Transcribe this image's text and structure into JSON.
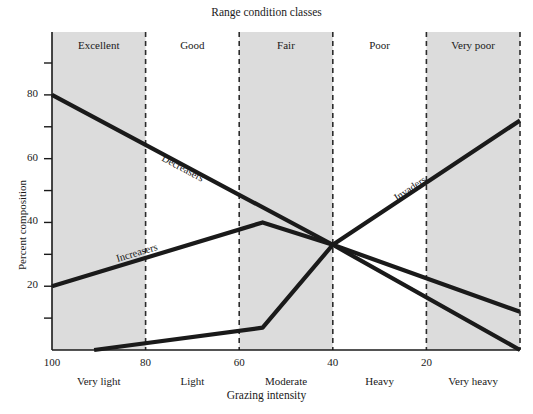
{
  "chart_data": {
    "type": "line",
    "title": "Range condition classes",
    "xlabel": "Grazing intensity",
    "ylabel": "Percent composition",
    "xlim": [
      100,
      0
    ],
    "ylim": [
      0,
      95
    ],
    "x_ticks_major": [
      100,
      80,
      60,
      40,
      20
    ],
    "x_ticks_major_labels": [
      "100",
      "80",
      "60",
      "40",
      "20"
    ],
    "y_ticks_major": [
      20,
      40,
      60,
      80
    ],
    "y_ticks_major_labels": [
      "20",
      "40",
      "60",
      "80"
    ],
    "y_ticks_minor": [
      10,
      30,
      50,
      70,
      90
    ],
    "grid": false,
    "legend_position": "inline-along-curves",
    "x_axis_direction": "reversed",
    "bands": [
      {
        "label": "Excellent",
        "from": 100,
        "to": 80,
        "shaded": true
      },
      {
        "label": "Good",
        "from": 80,
        "to": 60,
        "shaded": false
      },
      {
        "label": "Fair",
        "from": 60,
        "to": 40,
        "shaded": true
      },
      {
        "label": "Poor",
        "from": 40,
        "to": 20,
        "shaded": false
      },
      {
        "label": "Very poor",
        "from": 20,
        "to": 0,
        "shaded": true
      }
    ],
    "intensity_labels": [
      {
        "label": "Very light",
        "at": 90
      },
      {
        "label": "Light",
        "at": 70
      },
      {
        "label": "Moderate",
        "at": 50
      },
      {
        "label": "Heavy",
        "at": 30
      },
      {
        "label": "Very heavy",
        "at": 10
      }
    ],
    "series": [
      {
        "name": "Decreasers",
        "points": [
          [
            100,
            80
          ],
          [
            40,
            33
          ],
          [
            0,
            0
          ]
        ],
        "label_at": [
          77,
          59
        ]
      },
      {
        "name": "Increasers",
        "points": [
          [
            100,
            20
          ],
          [
            55,
            40
          ],
          [
            40,
            33
          ],
          [
            0,
            12
          ]
        ],
        "label_at": [
          86,
          27
        ]
      },
      {
        "name": "Invaders",
        "points": [
          [
            91,
            0
          ],
          [
            55,
            7
          ],
          [
            40,
            33
          ],
          [
            0,
            72
          ]
        ],
        "label_at": [
          26,
          46
        ]
      }
    ],
    "colors": {
      "band_shaded": "#dcdcdc",
      "band_plain": "#ffffff",
      "line": "#1a1a1a",
      "axis": "#1a1a1a",
      "divider": "#2b2b2b"
    }
  }
}
